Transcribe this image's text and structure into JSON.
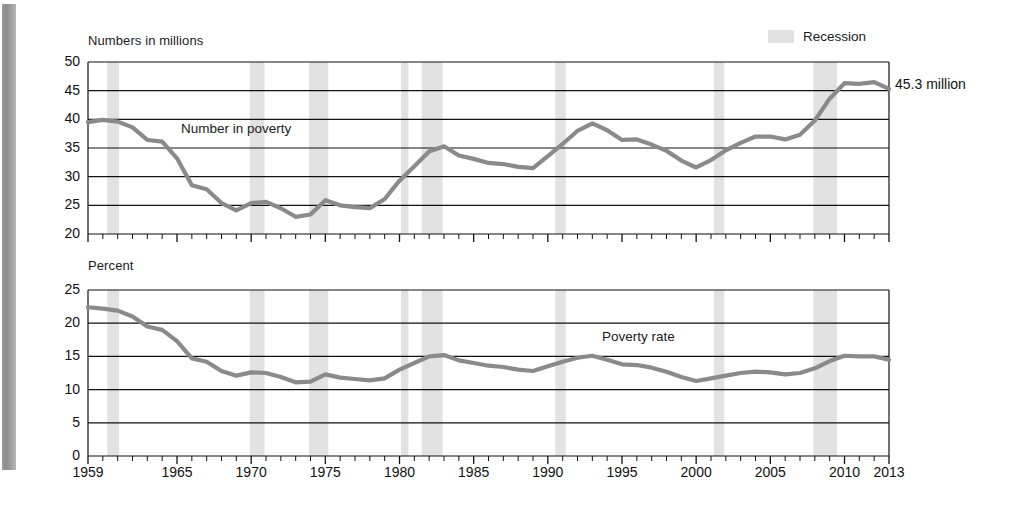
{
  "figure": {
    "legend": {
      "label": "Recession",
      "swatch_color": "#e2e2e2"
    },
    "line_color": "#8a8a8a",
    "axis_color": "#000000",
    "background": "#ffffff"
  },
  "chart_data": [
    {
      "type": "line",
      "id": "number-in-poverty",
      "title": "",
      "ylabel": "Numbers in millions",
      "xlabel": "",
      "series_label": "Number in poverty",
      "end_annotation": "45.3 million",
      "ylim": [
        20,
        50
      ],
      "yticks": [
        20,
        25,
        30,
        35,
        40,
        45,
        50
      ],
      "ytick_labels": [
        "20",
        "25",
        "30",
        "35",
        "40",
        "45",
        "50"
      ],
      "xlim": [
        1959,
        2013
      ],
      "xticks": [
        1959,
        1965,
        1970,
        1975,
        1980,
        1985,
        1990,
        1995,
        2000,
        2005,
        2010,
        2013
      ],
      "xtick_labels": [
        "1959",
        "1965",
        "1970",
        "1975",
        "1980",
        "1985",
        "1990",
        "1995",
        "2000",
        "2005",
        "2010",
        "2013"
      ],
      "grid": true,
      "legend_position": "top-right",
      "x": [
        1959,
        1960,
        1961,
        1962,
        1963,
        1964,
        1965,
        1966,
        1967,
        1968,
        1969,
        1970,
        1971,
        1972,
        1973,
        1974,
        1975,
        1976,
        1977,
        1978,
        1979,
        1980,
        1981,
        1982,
        1983,
        1984,
        1985,
        1986,
        1987,
        1988,
        1989,
        1990,
        1991,
        1992,
        1993,
        1994,
        1995,
        1996,
        1997,
        1998,
        1999,
        2000,
        2001,
        2002,
        2003,
        2004,
        2005,
        2006,
        2007,
        2008,
        2009,
        2010,
        2011,
        2012,
        2013
      ],
      "values": [
        39.5,
        39.9,
        39.6,
        38.6,
        36.4,
        36.1,
        33.2,
        28.5,
        27.8,
        25.4,
        24.1,
        25.4,
        25.6,
        24.5,
        23.0,
        23.4,
        25.9,
        25.0,
        24.7,
        24.5,
        26.1,
        29.3,
        31.8,
        34.4,
        35.3,
        33.7,
        33.1,
        32.4,
        32.2,
        31.7,
        31.5,
        33.6,
        35.7,
        38.0,
        39.3,
        38.1,
        36.4,
        36.5,
        35.6,
        34.5,
        32.8,
        31.6,
        32.9,
        34.6,
        35.9,
        37.0,
        37.0,
        36.5,
        37.3,
        39.8,
        43.6,
        46.3,
        46.2,
        46.5,
        45.3
      ],
      "unit": "millions"
    },
    {
      "type": "line",
      "id": "poverty-rate",
      "title": "",
      "ylabel": "Percent",
      "xlabel": "",
      "series_label": "Poverty rate",
      "end_annotation": "14.5 percent",
      "ylim": [
        0,
        25
      ],
      "yticks": [
        0,
        5,
        10,
        15,
        20,
        25
      ],
      "ytick_labels": [
        "0",
        "5",
        "10",
        "15",
        "20",
        "25"
      ],
      "xlim": [
        1959,
        2013
      ],
      "xticks": [
        1959,
        1965,
        1970,
        1975,
        1980,
        1985,
        1990,
        1995,
        2000,
        2005,
        2010,
        2013
      ],
      "xtick_labels": [
        "1959",
        "1965",
        "1970",
        "1975",
        "1980",
        "1985",
        "1990",
        "1995",
        "2000",
        "2005",
        "2010",
        "2013"
      ],
      "grid": true,
      "x": [
        1959,
        1960,
        1961,
        1962,
        1963,
        1964,
        1965,
        1966,
        1967,
        1968,
        1969,
        1970,
        1971,
        1972,
        1973,
        1974,
        1975,
        1976,
        1977,
        1978,
        1979,
        1980,
        1981,
        1982,
        1983,
        1984,
        1985,
        1986,
        1987,
        1988,
        1989,
        1990,
        1991,
        1992,
        1993,
        1994,
        1995,
        1996,
        1997,
        1998,
        1999,
        2000,
        2001,
        2002,
        2003,
        2004,
        2005,
        2006,
        2007,
        2008,
        2009,
        2010,
        2011,
        2012,
        2013
      ],
      "values": [
        22.4,
        22.2,
        21.9,
        21.0,
        19.5,
        19.0,
        17.3,
        14.7,
        14.2,
        12.8,
        12.1,
        12.6,
        12.5,
        11.9,
        11.1,
        11.2,
        12.3,
        11.8,
        11.6,
        11.4,
        11.7,
        13.0,
        14.0,
        15.0,
        15.2,
        14.4,
        14.0,
        13.6,
        13.4,
        13.0,
        12.8,
        13.5,
        14.2,
        14.8,
        15.1,
        14.5,
        13.8,
        13.7,
        13.3,
        12.7,
        11.9,
        11.3,
        11.7,
        12.1,
        12.5,
        12.7,
        12.6,
        12.3,
        12.5,
        13.2,
        14.3,
        15.1,
        15.0,
        15.0,
        14.5
      ],
      "unit": "percent"
    }
  ],
  "recessions": [
    {
      "start": 1960.3,
      "end": 1961.1
    },
    {
      "start": 1969.9,
      "end": 1970.9
    },
    {
      "start": 1973.9,
      "end": 1975.2
    },
    {
      "start": 1980.1,
      "end": 1980.6
    },
    {
      "start": 1981.5,
      "end": 1982.9
    },
    {
      "start": 1990.5,
      "end": 1991.2
    },
    {
      "start": 2001.2,
      "end": 2001.9
    },
    {
      "start": 2007.9,
      "end": 2009.5
    }
  ]
}
